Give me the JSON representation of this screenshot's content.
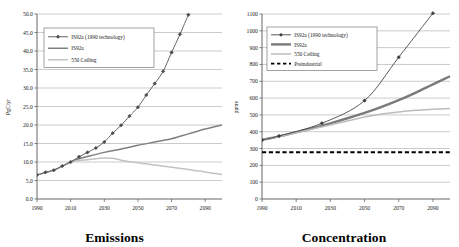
{
  "figure": {
    "panels": [
      {
        "id": "emissions",
        "title": "Emissions",
        "ylabel": "PgC/yr",
        "legend": [
          {
            "label": "IS92a (1990 technology)",
            "style": "line-marker",
            "color": "#4a4a4a"
          },
          {
            "label": "IS92a",
            "style": "line",
            "color": "#808080"
          },
          {
            "label": "550 Ceiling",
            "style": "line",
            "color": "#c2c2c2"
          }
        ]
      },
      {
        "id": "concentration",
        "title": "Concentration",
        "ylabel": "ppmv",
        "legend": [
          {
            "label": "IS92a (1990 technology)",
            "style": "line-marker",
            "color": "#3c3c3c"
          },
          {
            "label": "IS92a",
            "style": "line-thick",
            "color": "#7a7a7a"
          },
          {
            "label": "550 Ceiling",
            "style": "line",
            "color": "#bdbdbd"
          },
          {
            "label": "Preindustrial",
            "style": "dashed",
            "color": "#000000"
          }
        ]
      }
    ]
  },
  "chart_data": [
    {
      "type": "line",
      "id": "emissions",
      "title": "Emissions",
      "xlabel": "",
      "ylabel": "PgC/yr",
      "xlim": [
        1990,
        2100
      ],
      "ylim": [
        0.0,
        50.0
      ],
      "xticks": [
        1990,
        2010,
        2030,
        2050,
        2070,
        2090
      ],
      "yticks": [
        "0.0",
        "5.0",
        "10.0",
        "15.0",
        "20.0",
        "25.0",
        "30.0",
        "35.0",
        "40.0",
        "45.0",
        "50.0"
      ],
      "grid": true,
      "legend_position": "upper-left",
      "series": [
        {
          "name": "IS92a (1990 technology)",
          "color": "#4a4a4a",
          "marker": "diamond",
          "x": [
            1990,
            1995,
            2000,
            2005,
            2010,
            2015,
            2020,
            2025,
            2030,
            2035,
            2040,
            2045,
            2050,
            2055,
            2060,
            2065,
            2070,
            2075,
            2080
          ],
          "y": [
            6.5,
            7.2,
            7.8,
            8.9,
            10.0,
            11.4,
            12.6,
            13.8,
            15.4,
            17.8,
            19.9,
            22.4,
            24.8,
            28.1,
            31.2,
            34.5,
            39.6,
            44.5,
            49.8
          ]
        },
        {
          "name": "IS92a",
          "color": "#808080",
          "marker": "none",
          "x": [
            1990,
            2000,
            2010,
            2015,
            2020,
            2030,
            2040,
            2050,
            2060,
            2070,
            2080,
            2090,
            2100
          ],
          "y": [
            6.5,
            7.8,
            10.0,
            10.9,
            11.5,
            12.6,
            13.5,
            14.5,
            15.4,
            16.3,
            17.6,
            18.9,
            20.0
          ]
        },
        {
          "name": "550 Ceiling",
          "color": "#c2c2c2",
          "marker": "none",
          "x": [
            1990,
            2000,
            2010,
            2015,
            2020,
            2025,
            2030,
            2035,
            2040,
            2050,
            2060,
            2070,
            2080,
            2090,
            2100
          ],
          "y": [
            6.5,
            7.8,
            10.0,
            10.4,
            10.6,
            10.9,
            11.1,
            11.0,
            10.5,
            9.8,
            9.2,
            8.6,
            8.0,
            7.3,
            6.6
          ]
        }
      ]
    },
    {
      "type": "line",
      "id": "concentration",
      "title": "Concentration",
      "xlabel": "",
      "ylabel": "ppmv",
      "xlim": [
        1990,
        2100
      ],
      "ylim": [
        0,
        1100
      ],
      "xticks": [
        1990,
        2010,
        2030,
        2050,
        2070,
        2090
      ],
      "yticks": [
        0,
        100,
        200,
        300,
        400,
        500,
        600,
        700,
        800,
        900,
        1000,
        1100
      ],
      "grid": true,
      "legend_position": "upper-left",
      "series": [
        {
          "name": "IS92a (1990 technology)",
          "color": "#3c3c3c",
          "marker": "diamond",
          "x": [
            1990,
            2000,
            2025,
            2050,
            2070,
            2090
          ],
          "y": [
            350,
            375,
            450,
            585,
            843,
            1105
          ]
        },
        {
          "name": "IS92a",
          "color": "#7a7a7a",
          "marker": "none",
          "x": [
            1990,
            2000,
            2010,
            2020,
            2030,
            2040,
            2050,
            2060,
            2070,
            2080,
            2090,
            2100
          ],
          "y": [
            352,
            372,
            396,
            422,
            450,
            480,
            512,
            548,
            588,
            633,
            682,
            730
          ]
        },
        {
          "name": "550 Ceiling",
          "color": "#bdbdbd",
          "marker": "none",
          "x": [
            1990,
            2000,
            2010,
            2020,
            2030,
            2040,
            2050,
            2060,
            2070,
            2080,
            2090,
            2100
          ],
          "y": [
            352,
            372,
            394,
            417,
            440,
            464,
            487,
            505,
            518,
            527,
            533,
            538
          ]
        },
        {
          "name": "Preindustrial",
          "color": "#000000",
          "marker": "none",
          "style": "dashed",
          "x": [
            1990,
            2100
          ],
          "y": [
            278,
            278
          ]
        }
      ]
    }
  ]
}
